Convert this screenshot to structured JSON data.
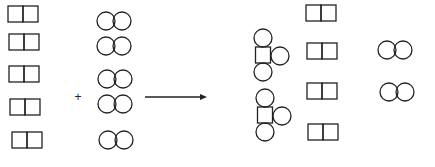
{
  "diagram": {
    "type": "chemical-reaction-particle-diagram",
    "colors": {
      "stroke": "#222222",
      "background": "#ffffff"
    },
    "operator": {
      "symbol": "+",
      "x": 78,
      "y": 97
    },
    "arrow": {
      "x1": 145,
      "x2": 207,
      "y": 97
    },
    "reactants": {
      "square_pairs": [
        {
          "x": 23,
          "y": 14
        },
        {
          "x": 24,
          "y": 42
        },
        {
          "x": 24,
          "y": 74
        },
        {
          "x": 25,
          "y": 107
        },
        {
          "x": 27,
          "y": 140
        }
      ],
      "circle_pairs": [
        {
          "x": 114,
          "y": 21
        },
        {
          "x": 114,
          "y": 46
        },
        {
          "x": 115,
          "y": 79
        },
        {
          "x": 115,
          "y": 104
        },
        {
          "x": 116,
          "y": 140
        }
      ]
    },
    "products": {
      "compounds": [
        {
          "x": 263,
          "y": 55
        },
        {
          "x": 265,
          "y": 115
        }
      ],
      "leftover_square_pairs": [
        {
          "x": 321,
          "y": 13
        },
        {
          "x": 322,
          "y": 51
        },
        {
          "x": 322,
          "y": 91
        },
        {
          "x": 323,
          "y": 132
        }
      ],
      "leftover_circle_pairs": [
        {
          "x": 395,
          "y": 50
        },
        {
          "x": 397,
          "y": 92
        }
      ]
    },
    "legend": {
      "square_pair": "diatomic molecule of square atoms",
      "circle_pair": "diatomic molecule of circle atoms",
      "compound": "square atom bonded to three circle atoms"
    }
  }
}
